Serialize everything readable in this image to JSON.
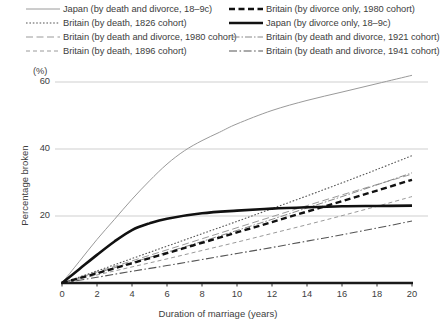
{
  "chart_data": {
    "type": "line",
    "title": "",
    "xlabel": "Duration of marriage (years)",
    "ylabel": "Percentage broken",
    "yunit": "(%)",
    "xlim": [
      0,
      20
    ],
    "ylim": [
      0,
      66
    ],
    "xticks": [
      0,
      2,
      4,
      6,
      8,
      10,
      12,
      14,
      16,
      18,
      20
    ],
    "yticks": [
      20,
      40,
      60
    ],
    "grid": "horizontal",
    "legend_position": "top",
    "series": [
      {
        "name": "Japan (by death and divorce, 18–9c)",
        "style": "solid-thin",
        "color": "#9a9a9a",
        "width": 1.0,
        "dash": "",
        "x": [
          0,
          1,
          2,
          3,
          4,
          5,
          6,
          7,
          8,
          9,
          10,
          12,
          14,
          16,
          18,
          20
        ],
        "values": [
          0,
          6.5,
          13,
          19,
          25,
          30.5,
          35.5,
          39.5,
          42.5,
          45,
          47.5,
          51.5,
          54.5,
          57,
          59.5,
          62
        ]
      },
      {
        "name": "Britain (by death, 1826 cohort)",
        "style": "dotted",
        "color": "#555555",
        "width": 1.1,
        "dash": "1.6,1.8",
        "x": [
          0,
          2,
          4,
          6,
          8,
          10,
          12,
          14,
          16,
          18,
          20
        ],
        "values": [
          0,
          3.6,
          7.3,
          11.0,
          14.7,
          18.4,
          22.2,
          26.0,
          29.9,
          33.9,
          38.0
        ]
      },
      {
        "name": "Britain (by death and divorce, 1980 cohort)",
        "style": "long-dash-thin",
        "color": "#9a9a9a",
        "width": 1.0,
        "dash": "7,3.5",
        "x": [
          0,
          2,
          4,
          6,
          8,
          10,
          12,
          14,
          16,
          18,
          20
        ],
        "values": [
          0,
          3.3,
          6.6,
          9.9,
          13.2,
          16.5,
          19.8,
          23.1,
          26.3,
          29.4,
          32.5
        ]
      },
      {
        "name": "Britain (by death, 1896 cohort)",
        "style": "dashed-thin",
        "color": "#9a9a9a",
        "width": 1.0,
        "dash": "4,3",
        "x": [
          0,
          2,
          4,
          6,
          8,
          10,
          12,
          14,
          16,
          18,
          20
        ],
        "values": [
          0,
          2.4,
          4.8,
          7.2,
          9.7,
          12.2,
          14.8,
          17.4,
          20.1,
          22.9,
          25.8
        ]
      },
      {
        "name": "Britain (by divorce only, 1980 cohort)",
        "style": "dashed-bold",
        "color": "#111111",
        "width": 2.4,
        "dash": "6,3.5",
        "x": [
          0,
          2,
          4,
          6,
          8,
          10,
          12,
          14,
          16,
          18,
          20
        ],
        "values": [
          0,
          2.9,
          5.9,
          8.9,
          12.0,
          15.1,
          18.2,
          21.3,
          24.4,
          27.6,
          30.8
        ]
      },
      {
        "name": "Japan (by divorce only, 18–9c)",
        "style": "solid-bold",
        "color": "#111111",
        "width": 2.6,
        "dash": "",
        "x": [
          0,
          1,
          2,
          3,
          4,
          5,
          6,
          8,
          10,
          12,
          14,
          16,
          18,
          20
        ],
        "values": [
          0,
          4.2,
          8.4,
          12.4,
          15.8,
          17.8,
          19.2,
          20.8,
          21.6,
          22.2,
          22.6,
          22.9,
          23.0,
          23.1
        ]
      },
      {
        "name": "Britain (by death and divorce, 1921 cohort)",
        "style": "dash-dot-thin",
        "color": "#888888",
        "width": 1.0,
        "dash": "1.5,2,7,2",
        "x": [
          0,
          2,
          4,
          6,
          8,
          10,
          12,
          14,
          16,
          18,
          20
        ],
        "values": [
          0,
          3.0,
          6.1,
          9.2,
          12.4,
          15.7,
          19.0,
          22.4,
          25.8,
          29.3,
          32.9
        ]
      },
      {
        "name": "Britain (by death and divorce, 1941 cohort)",
        "style": "dash-dot-long",
        "color": "#555555",
        "width": 1.1,
        "dash": "8,2.5,1.6,2.5",
        "x": [
          0,
          2,
          4,
          6,
          8,
          10,
          12,
          14,
          16,
          18,
          20
        ],
        "values": [
          0,
          1.7,
          3.5,
          5.2,
          7.0,
          8.8,
          10.6,
          12.5,
          14.4,
          16.4,
          18.5
        ]
      }
    ]
  },
  "legend": {
    "left_items": [
      {
        "label": "Japan (by death and divorce, 18–9c)",
        "series_index": 0
      },
      {
        "label": "Britain (by death, 1826 cohort)",
        "series_index": 1
      },
      {
        "label": "Britain (by death and divorce, 1980 cohort)",
        "series_index": 2
      },
      {
        "label": "Britain (by death, 1896 cohort)",
        "series_index": 3
      }
    ],
    "right_items": [
      {
        "label": "Britain (by divorce only, 1980 cohort)",
        "series_index": 4
      },
      {
        "label": "Japan (by divorce only, 18–9c)",
        "series_index": 5
      },
      {
        "label": "Britain (by death and divorce, 1921 cohort)",
        "series_index": 6
      },
      {
        "label": "Britain (by death and divorce, 1941 cohort)",
        "series_index": 7
      }
    ]
  },
  "axis": {
    "yunit_label": "(%)",
    "ylabel": "Percentage broken",
    "xlabel": "Duration of marriage (years)"
  },
  "colors": {
    "axis": "#1a1a1a",
    "grid": "#c9c9c9",
    "text": "#3d3d3d"
  }
}
